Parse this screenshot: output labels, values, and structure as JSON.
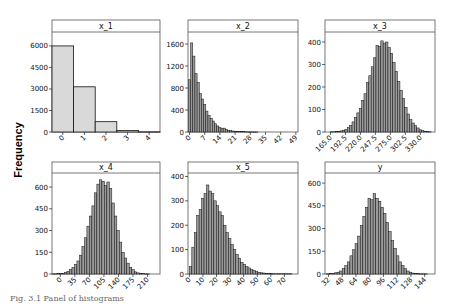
{
  "figure": {
    "ylabel": "Frequency",
    "caption": "Fig. 3.1  Panel of histograms",
    "bar_fill_discrete": "#d9d9d9",
    "bar_fill_continuous": "#9a9a9a",
    "bar_stroke": "#111111"
  },
  "chart_data": [
    {
      "type": "bar",
      "title": "x_1",
      "xlabel": "",
      "ylabel": "Frequency",
      "ylim": [
        0,
        6900
      ],
      "yticks": [
        0,
        1500,
        3000,
        4500,
        6000
      ],
      "xlim": [
        -0.5,
        4.5
      ],
      "xticks": [
        0,
        1,
        2,
        3,
        4
      ],
      "bin_start": -0.5,
      "bin_width": 1,
      "values": [
        6000,
        3150,
        720,
        110,
        10
      ],
      "discrete": true
    },
    {
      "type": "bar",
      "title": "x_2",
      "xlabel": "",
      "ylabel": "Frequency",
      "ylim": [
        0,
        1800
      ],
      "yticks": [
        0,
        400,
        800,
        1200,
        1600
      ],
      "xlim": [
        -0.7,
        50
      ],
      "xticks": [
        0,
        7,
        14,
        21,
        28,
        35,
        42,
        49
      ],
      "bin_start": -0.5,
      "bin_width": 1,
      "values": [
        950,
        1620,
        1380,
        1060,
        900,
        700,
        600,
        500,
        380,
        300,
        250,
        200,
        150,
        110,
        80,
        60,
        70,
        45,
        30,
        25,
        18,
        15,
        10,
        8,
        6,
        5,
        4,
        3,
        2,
        2,
        1,
        1
      ],
      "discrete": false
    },
    {
      "type": "bar",
      "title": "x_3",
      "xlabel": "",
      "ylabel": "Frequency",
      "ylim": [
        0,
        440
      ],
      "yticks": [
        0,
        100,
        200,
        300,
        400
      ],
      "xlim": [
        155,
        357
      ],
      "xticks": [
        "165.0",
        "192.5",
        "220.0",
        "247.5",
        "275.0",
        "302.5",
        "330.0"
      ],
      "xtick_values": [
        165,
        192.5,
        220,
        247.5,
        275,
        302.5,
        330
      ],
      "bin_start": 165,
      "bin_width": 4.4,
      "values": [
        1,
        1,
        2,
        3,
        5,
        8,
        12,
        20,
        30,
        45,
        65,
        85,
        105,
        140,
        170,
        220,
        250,
        290,
        330,
        385,
        380,
        405,
        395,
        400,
        375,
        350,
        310,
        270,
        225,
        185,
        150,
        110,
        80,
        55,
        40,
        28,
        18,
        10,
        6,
        3,
        2,
        1
      ],
      "discrete": false
    },
    {
      "type": "bar",
      "title": "x_4",
      "xlabel": "",
      "ylabel": "Frequency",
      "ylim": [
        0,
        690
      ],
      "yticks": [
        0,
        150,
        300,
        450,
        600
      ],
      "xlim": [
        -20,
        240
      ],
      "xticks": [
        0,
        35,
        70,
        105,
        140,
        175,
        210
      ],
      "bin_start": -20,
      "bin_width": 6,
      "values": [
        1,
        1,
        2,
        3,
        5,
        10,
        18,
        30,
        45,
        65,
        90,
        130,
        190,
        250,
        330,
        400,
        470,
        560,
        620,
        650,
        640,
        610,
        635,
        590,
        490,
        400,
        300,
        220,
        150,
        110,
        75,
        45,
        30,
        15,
        8,
        4,
        2,
        1,
        1
      ],
      "discrete": false
    },
    {
      "type": "bar",
      "title": "x_5",
      "xlabel": "",
      "ylabel": "Frequency",
      "ylim": [
        0,
        410
      ],
      "yticks": [
        0,
        100,
        200,
        300,
        400
      ],
      "xlim": [
        -1,
        80
      ],
      "xticks": [
        0,
        10,
        20,
        30,
        40,
        50,
        60,
        70
      ],
      "bin_start": 0,
      "bin_width": 1.8,
      "values": [
        30,
        110,
        170,
        240,
        265,
        310,
        330,
        365,
        340,
        330,
        300,
        280,
        255,
        240,
        200,
        170,
        145,
        120,
        100,
        80,
        65,
        48,
        40,
        30,
        25,
        18,
        14,
        10,
        7,
        5,
        4,
        3,
        2,
        2,
        1,
        1,
        1,
        1,
        1,
        1,
        1,
        1
      ],
      "discrete": false
    },
    {
      "type": "bar",
      "title": "y",
      "xlabel": "",
      "ylabel": "Frequency",
      "ylim": [
        0,
        660
      ],
      "yticks": [
        0,
        150,
        300,
        450,
        600
      ],
      "xlim": [
        28,
        156
      ],
      "xticks": [
        32,
        48,
        64,
        80,
        96,
        112,
        128,
        144
      ],
      "bin_start": 30,
      "bin_width": 3,
      "values": [
        1,
        2,
        4,
        8,
        12,
        20,
        35,
        55,
        80,
        120,
        160,
        200,
        250,
        320,
        380,
        440,
        500,
        490,
        530,
        500,
        480,
        440,
        400,
        340,
        280,
        220,
        170,
        120,
        80,
        55,
        35,
        20,
        12,
        6,
        3,
        2,
        1,
        1,
        1
      ],
      "discrete": false
    }
  ]
}
